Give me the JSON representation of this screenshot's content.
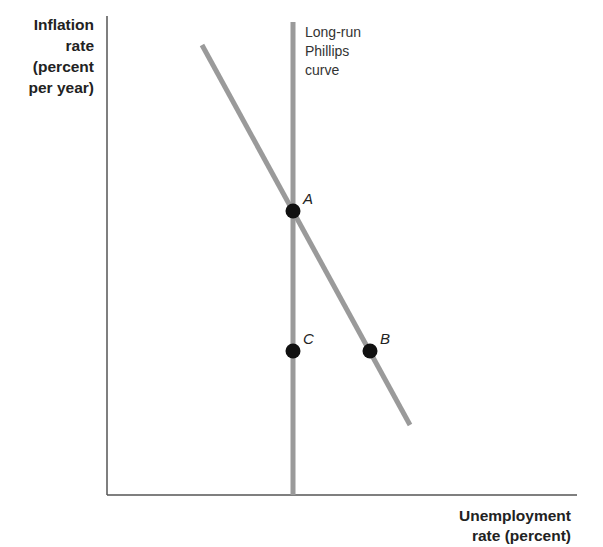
{
  "chart_data": {
    "type": "line",
    "title": "",
    "ylabel": "Inflation rate (percent per year)",
    "ylabel_lines": [
      "Inflation",
      "rate",
      "(percent",
      "per year)"
    ],
    "xlabel": "Unemployment rate (percent)",
    "xlabel_lines": [
      "Unemployment",
      "rate (percent)"
    ],
    "grid": false,
    "ticks": "none",
    "series": [
      {
        "name": "Long-run Phillips curve",
        "label_lines": [
          "Long-run",
          "Phillips",
          "curve"
        ],
        "kind": "vertical",
        "color": "#9a9a9a",
        "x": 293,
        "y_from": 22,
        "y_to": 495
      },
      {
        "name": "Short-run Phillips curve",
        "kind": "downward-sloping",
        "color": "#9a9a9a",
        "from": [
          202,
          45
        ],
        "to": [
          410,
          425
        ]
      }
    ],
    "points": [
      {
        "label": "A",
        "x": 293,
        "y": 211,
        "description": "Intersection of long-run and short-run Phillips curves"
      },
      {
        "label": "B",
        "x": 370,
        "y": 351,
        "description": "On short-run curve: higher unemployment, lower inflation"
      },
      {
        "label": "C",
        "x": 293,
        "y": 351,
        "description": "On long-run curve: natural unemployment, lower inflation"
      }
    ],
    "axes": {
      "origin": [
        107,
        495
      ],
      "y_top": 16,
      "x_right": 577,
      "color": "#555555"
    }
  }
}
